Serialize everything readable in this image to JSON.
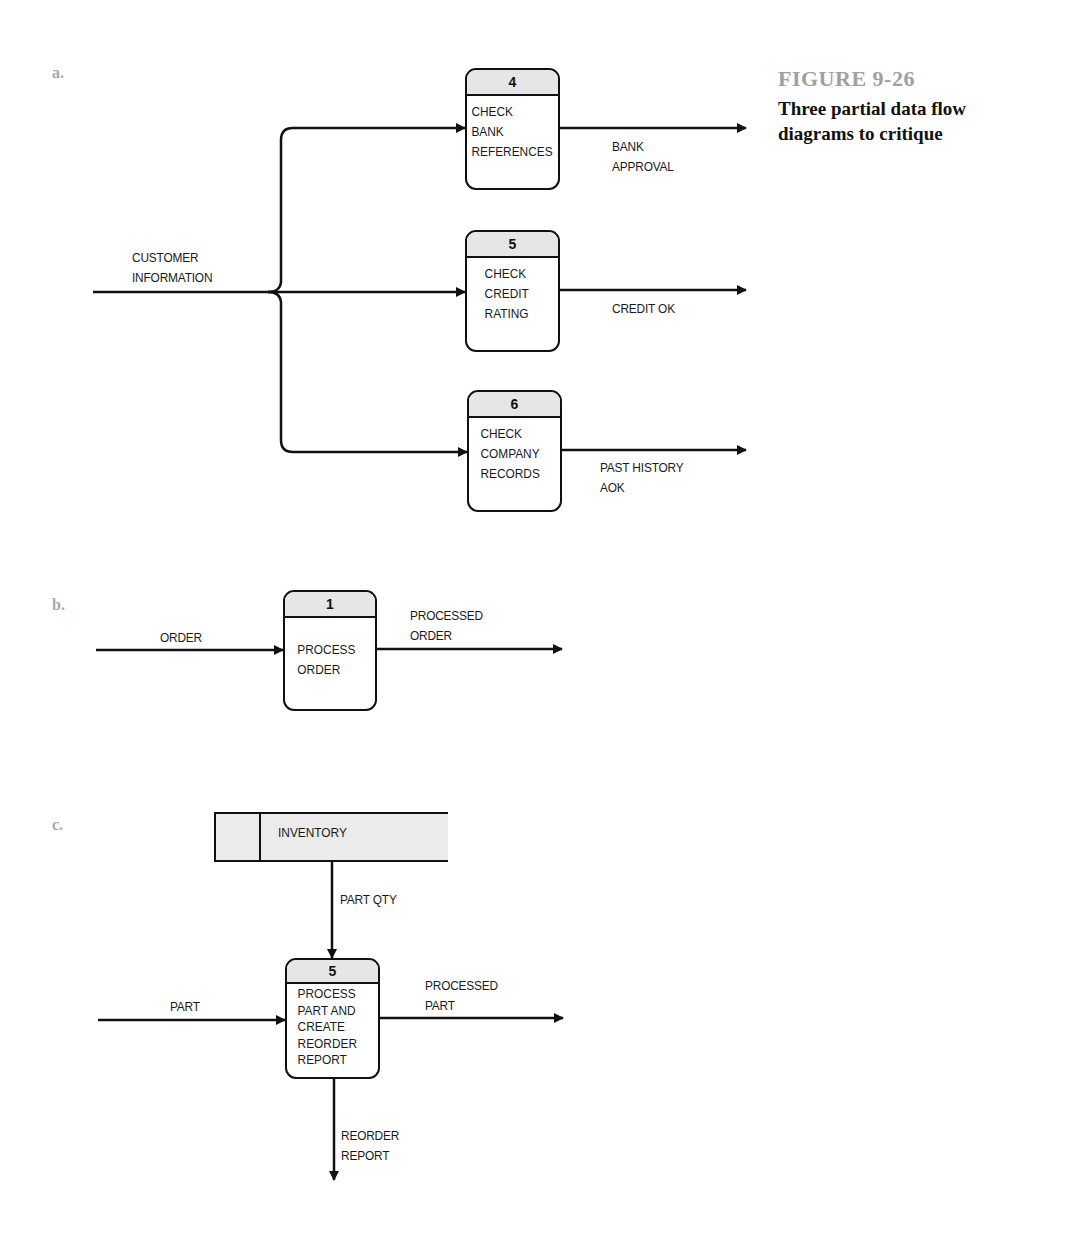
{
  "figure": {
    "number": "FIGURE 9-26",
    "caption": "Three partial data flow\ndiagrams to critique"
  },
  "diagram_a": {
    "label": "a.",
    "input_flow": "CUSTOMER\nINFORMATION",
    "processes": [
      {
        "id": "4",
        "name": "CHECK\nBANK\nREFERENCES",
        "output_flow": "BANK\nAPPROVAL"
      },
      {
        "id": "5",
        "name": "CHECK\nCREDIT\nRATING",
        "output_flow": "CREDIT OK"
      },
      {
        "id": "6",
        "name": "CHECK\nCOMPANY\nRECORDS",
        "output_flow": "PAST HISTORY\nAOK"
      }
    ]
  },
  "diagram_b": {
    "label": "b.",
    "input_flow": "ORDER",
    "process": {
      "id": "1",
      "name": "PROCESS\nORDER"
    },
    "output_flow": "PROCESSED\nORDER"
  },
  "diagram_c": {
    "label": "c.",
    "data_store": {
      "name": "INVENTORY"
    },
    "store_flow": "PART QTY",
    "input_flow": "PART",
    "process": {
      "id": "5",
      "name": "PROCESS\nPART AND\nCREATE\nREORDER\nREPORT"
    },
    "output_flow": "PROCESSED\nPART",
    "down_flow": "REORDER\nREPORT"
  },
  "colors": {
    "line": "#111111",
    "header_fill": "#e6e6e6",
    "store_fill": "#ebebeb",
    "part_label": "#a8a8a8",
    "figure_number": "#a0a0a0"
  }
}
